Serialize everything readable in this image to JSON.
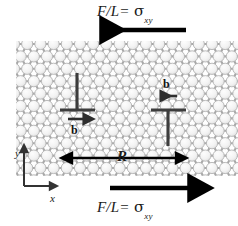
{
  "figure": {
    "width": 238,
    "height": 226,
    "background": "#ffffff"
  },
  "labels": {
    "top_stress": {
      "force": "F/L",
      "equals": "=",
      "sigma": "σ",
      "subscript": "xy",
      "arrow_direction": "left"
    },
    "bottom_stress": {
      "force": "F/L",
      "equals": "=",
      "sigma": "σ",
      "subscript": "xy",
      "arrow_direction": "right"
    },
    "separation": "R",
    "burgers_left": "b",
    "burgers_right": "b",
    "axis_x": "x",
    "axis_y": "y"
  },
  "lattice": {
    "kind": "hexagonal-close-packed-circles",
    "circle_fill": "#f2f2f2",
    "circle_stroke": "#b3b3b3",
    "bond_color": "#a8a8a8",
    "rows": 11,
    "cols": 18,
    "spacing_x": 13.2,
    "spacing_y": 12.4,
    "radius": 5.6
  },
  "colors": {
    "arrow": "#000000",
    "dislocation": "#3d3d3d",
    "axes": "#333333",
    "text": "#1a1a1a"
  },
  "dislocations": [
    {
      "name": "left-dislocation",
      "glyph": "inverted-T",
      "burgers_arrow": "right",
      "x": 77,
      "y": 110
    },
    {
      "name": "right-dislocation",
      "glyph": "T",
      "burgers_arrow": "left",
      "x": 168,
      "y": 110
    }
  ]
}
